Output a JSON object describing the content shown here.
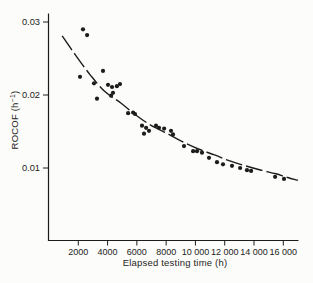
{
  "figure": {
    "background": "#fcfcfa",
    "ink_color": "#1c1c1c"
  },
  "chart_data": {
    "type": "scatter",
    "title": "",
    "xlabel": "Elapsed testing time (h)",
    "ylabel": "ROCOF (h⁻¹)",
    "ylabel_parts": {
      "prefix": "ROCOF (h",
      "sup": "−1",
      "suffix": ")"
    },
    "xlim": [
      0,
      17000
    ],
    "ylim": [
      0,
      0.031
    ],
    "grid": false,
    "legend": null,
    "x_ticks": [
      {
        "value": 2000,
        "label": "2000"
      },
      {
        "value": 4000,
        "label": "4000"
      },
      {
        "value": 6000,
        "label": "6000"
      },
      {
        "value": 8000,
        "label": "8000"
      },
      {
        "value": 10000,
        "label": "10 000"
      },
      {
        "value": 12000,
        "label": "12 000"
      },
      {
        "value": 14000,
        "label": "14 000"
      },
      {
        "value": 16000,
        "label": "16 000"
      }
    ],
    "y_ticks": [
      {
        "value": 0.01,
        "label": "0.01"
      },
      {
        "value": 0.02,
        "label": "0.02"
      },
      {
        "value": 0.03,
        "label": "0.03"
      }
    ],
    "points": [
      [
        2120,
        0.0225
      ],
      [
        2320,
        0.029
      ],
      [
        2600,
        0.0282
      ],
      [
        3070,
        0.0216
      ],
      [
        3280,
        0.0195
      ],
      [
        3690,
        0.0233
      ],
      [
        4030,
        0.0214
      ],
      [
        4240,
        0.0199
      ],
      [
        4300,
        0.0211
      ],
      [
        4370,
        0.0203
      ],
      [
        4640,
        0.0212
      ],
      [
        4850,
        0.0215
      ],
      [
        5400,
        0.0175
      ],
      [
        5740,
        0.0176
      ],
      [
        5870,
        0.0174
      ],
      [
        6350,
        0.0158
      ],
      [
        6490,
        0.0147
      ],
      [
        6630,
        0.0155
      ],
      [
        6830,
        0.0151
      ],
      [
        7310,
        0.0158
      ],
      [
        7510,
        0.0155
      ],
      [
        7860,
        0.0154
      ],
      [
        8330,
        0.0151
      ],
      [
        8470,
        0.0146
      ],
      [
        9220,
        0.013
      ],
      [
        9840,
        0.0123
      ],
      [
        10110,
        0.0123
      ],
      [
        10450,
        0.0121
      ],
      [
        10930,
        0.0114
      ],
      [
        11470,
        0.0108
      ],
      [
        11880,
        0.0105
      ],
      [
        12500,
        0.0103
      ],
      [
        13050,
        0.01
      ],
      [
        13520,
        0.0097
      ],
      [
        13800,
        0.0096
      ],
      [
        15440,
        0.0088
      ],
      [
        16050,
        0.0085
      ]
    ],
    "fit_curve": {
      "style": "dashed",
      "points": [
        [
          900,
          0.0281
        ],
        [
          1800,
          0.0255
        ],
        [
          2800,
          0.0228
        ],
        [
          3800,
          0.0205
        ],
        [
          4900,
          0.0189
        ],
        [
          5900,
          0.0173
        ],
        [
          7000,
          0.0158
        ],
        [
          8100,
          0.0147
        ],
        [
          9100,
          0.0136
        ],
        [
          10200,
          0.0126
        ],
        [
          11300,
          0.0118
        ],
        [
          12300,
          0.011
        ],
        [
          13400,
          0.0103
        ],
        [
          14500,
          0.0097
        ],
        [
          15500,
          0.0092
        ],
        [
          16300,
          0.0087
        ],
        [
          17000,
          0.0083
        ]
      ]
    }
  }
}
